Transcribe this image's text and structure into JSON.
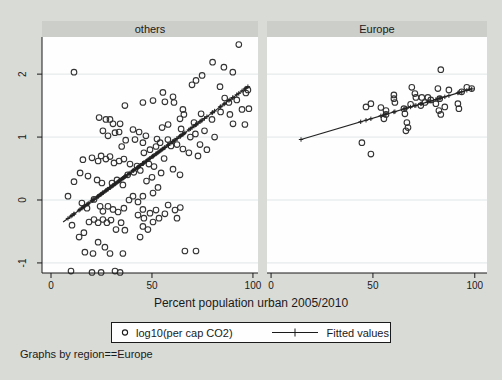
{
  "caption": "Graphs by region==Europe",
  "legend": {
    "items": [
      {
        "marker": "circle-marker-icon",
        "label": "log10(per cap CO2)"
      },
      {
        "marker": "fitted-line-icon",
        "label": "Fitted values"
      }
    ]
  },
  "colors": {
    "background": "#d9dbd7",
    "panel_title_band": "#cccec9",
    "plot_background": "#fefefe",
    "gridline": "#e0e6e7",
    "ink": "#1a1a1a"
  },
  "chart_data": {
    "type": "scatter",
    "title": "",
    "xlabel": "Percent population urban 2005/2010",
    "ylabel": "",
    "xticks": [
      0,
      50,
      100
    ],
    "yticks": [
      2,
      1,
      0,
      -1
    ],
    "ylim": [
      -1.16,
      2.59
    ],
    "grid": "horizontal",
    "legend_position": "bottom",
    "series_labels": [
      "log10(per cap CO2)",
      "Fitted values"
    ],
    "panels": [
      {
        "title": "others",
        "xlim": [
          -4.46,
          102.5
        ],
        "fit": {
          "slope": 0.0235,
          "intercept": -0.49,
          "x_range": [
            6,
            97.5
          ]
        },
        "points": [
          [
            11.4,
            2.03
          ],
          [
            93,
            2.47
          ],
          [
            80,
            2.19
          ],
          [
            85.6,
            2.11
          ],
          [
            90,
            2.03
          ],
          [
            74.8,
            1.98
          ],
          [
            83.7,
            1.8
          ],
          [
            69.8,
            1.83
          ],
          [
            71.8,
            1.9
          ],
          [
            55.4,
            1.71
          ],
          [
            60.4,
            1.64
          ],
          [
            92,
            1.59
          ],
          [
            36.6,
            1.5
          ],
          [
            45.5,
            1.55
          ],
          [
            50.5,
            1.58
          ],
          [
            56.4,
            1.56
          ],
          [
            60.9,
            1.55
          ],
          [
            65.3,
            1.44
          ],
          [
            65.8,
            1.36
          ],
          [
            74.3,
            1.37
          ],
          [
            70.8,
            1.23
          ],
          [
            63.9,
            1.29
          ],
          [
            64.4,
            1.13
          ],
          [
            79.7,
            1.28
          ],
          [
            88.6,
            1.36
          ],
          [
            90.1,
            1.21
          ],
          [
            94.6,
            1.44
          ],
          [
            88.1,
            1.55
          ],
          [
            23.8,
            1.31
          ],
          [
            27.2,
            1.28
          ],
          [
            29.2,
            1.28
          ],
          [
            30.7,
            1.21
          ],
          [
            34.2,
            1.21
          ],
          [
            25.7,
            1.1
          ],
          [
            28.2,
            1.02
          ],
          [
            31.7,
            1.07
          ],
          [
            33.7,
            1.08
          ],
          [
            40.6,
            1.12
          ],
          [
            43.6,
            1.08
          ],
          [
            47,
            1.02
          ],
          [
            41.6,
            0.96
          ],
          [
            45.5,
            0.91
          ],
          [
            52.5,
            0.97
          ],
          [
            54,
            0.91
          ],
          [
            57.9,
            0.96
          ],
          [
            59.4,
            0.86
          ],
          [
            62.4,
            0.88
          ],
          [
            65.3,
            0.81
          ],
          [
            68.3,
            0.75
          ],
          [
            73.8,
            0.88
          ],
          [
            77.2,
            0.8
          ],
          [
            72.8,
            0.7
          ],
          [
            15.8,
            0.64
          ],
          [
            20.3,
            0.67
          ],
          [
            23.3,
            0.62
          ],
          [
            24.8,
            0.7
          ],
          [
            27.2,
            0.65
          ],
          [
            29.2,
            0.69
          ],
          [
            31.2,
            0.59
          ],
          [
            33.7,
            0.62
          ],
          [
            36.1,
            0.65
          ],
          [
            39.1,
            0.57
          ],
          [
            42.6,
            0.54
          ],
          [
            48.5,
            0.57
          ],
          [
            51,
            0.53
          ],
          [
            60.4,
            0.49
          ],
          [
            54.5,
            0.43
          ],
          [
            63.9,
            0.4
          ],
          [
            14.4,
            0.43
          ],
          [
            18.3,
            0.38
          ],
          [
            11.4,
            0.29
          ],
          [
            22.8,
            0.32
          ],
          [
            25.2,
            0.27
          ],
          [
            30.2,
            0.27
          ],
          [
            32.7,
            0.32
          ],
          [
            35.6,
            0.24
          ],
          [
            38,
            0.4
          ],
          [
            41,
            0.44
          ],
          [
            44.2,
            0.47
          ],
          [
            47.3,
            0.3
          ],
          [
            50,
            0.36
          ],
          [
            53,
            0.2
          ],
          [
            56,
            0.66
          ],
          [
            46,
            0.75
          ],
          [
            49,
            0.8
          ],
          [
            52,
            0.85
          ],
          [
            55,
            1.15
          ],
          [
            58,
            1.2
          ],
          [
            37,
            0.95
          ],
          [
            35,
            0.85
          ],
          [
            69,
            1
          ],
          [
            71.5,
            1.05
          ],
          [
            76,
            1.1
          ],
          [
            81,
            1
          ],
          [
            84,
            1.4
          ],
          [
            86,
            1.62
          ],
          [
            96,
            1.2
          ],
          [
            96.5,
            1.7
          ],
          [
            97.5,
            1.75
          ],
          [
            98,
            1.45
          ],
          [
            8.4,
            0.06
          ],
          [
            15.3,
            -0.05
          ],
          [
            17.8,
            -0.13
          ],
          [
            21.3,
            0.01
          ],
          [
            24.3,
            -0.1
          ],
          [
            25.7,
            -0.18
          ],
          [
            28.2,
            -0.1
          ],
          [
            30.7,
            -0.15
          ],
          [
            33.2,
            -0.19
          ],
          [
            36.1,
            -0.13
          ],
          [
            38.6,
            0
          ],
          [
            40.6,
            0.06
          ],
          [
            43.1,
            -0.03
          ],
          [
            45.5,
            -0.15
          ],
          [
            49,
            -0.21
          ],
          [
            52,
            -0.16
          ],
          [
            56.4,
            -0.22
          ],
          [
            45.5,
            0.06
          ],
          [
            50.5,
            0.11
          ],
          [
            10.4,
            -0.4
          ],
          [
            13.9,
            -0.59
          ],
          [
            16.3,
            -0.52
          ],
          [
            18.8,
            -0.35
          ],
          [
            21.3,
            -0.31
          ],
          [
            23.3,
            -0.36
          ],
          [
            25.7,
            -0.31
          ],
          [
            27.7,
            -0.36
          ],
          [
            29.7,
            -0.32
          ],
          [
            32.2,
            -0.47
          ],
          [
            34.7,
            -0.36
          ],
          [
            36.6,
            -0.48
          ],
          [
            43.1,
            -0.24
          ],
          [
            46,
            -0.29
          ],
          [
            45.5,
            -0.42
          ],
          [
            23.3,
            -0.67
          ],
          [
            26.7,
            -0.75
          ],
          [
            16.8,
            -0.83
          ],
          [
            20.8,
            -0.85
          ],
          [
            29.2,
            -0.85
          ],
          [
            35.6,
            -0.85
          ],
          [
            9.9,
            -1.13
          ],
          [
            20.3,
            -1.15
          ],
          [
            24.8,
            -1.15
          ],
          [
            31.7,
            -1.13
          ],
          [
            34.2,
            -1.15
          ],
          [
            44.1,
            -0.59
          ],
          [
            48,
            -0.47
          ],
          [
            50.5,
            -0.35
          ],
          [
            53.5,
            -0.29
          ],
          [
            62.4,
            -0.29
          ],
          [
            61.4,
            -0.16
          ],
          [
            64,
            -0.12
          ],
          [
            66.3,
            -0.81
          ],
          [
            71.8,
            -0.81
          ],
          [
            58,
            -0.08
          ]
        ]
      },
      {
        "title": "Europe",
        "xlim": [
          -2,
          106
        ],
        "fit": {
          "slope": 0.0096,
          "intercept": 0.82,
          "x_range": [
            14.7,
            98.5
          ],
          "marker_xs": [
            14.7,
            44,
            46.6,
            49,
            53.9,
            55.4,
            56.4,
            60.3,
            60.8,
            65.2,
            65.7,
            66.7,
            68.5,
            70.6,
            71.1,
            73.5,
            74,
            77,
            78.4,
            80.9,
            82,
            82.8,
            83.3,
            85.3,
            87.3,
            91.7,
            92.2,
            93.6,
            96.1,
            98.5
          ]
        },
        "points": [
          [
            83.3,
            2.07
          ],
          [
            69.1,
            1.79
          ],
          [
            81.9,
            1.77
          ],
          [
            87.3,
            1.75
          ],
          [
            96.1,
            1.79
          ],
          [
            98.5,
            1.77
          ],
          [
            60.3,
            1.67
          ],
          [
            60.3,
            1.61
          ],
          [
            60.8,
            1.55
          ],
          [
            70.6,
            1.69
          ],
          [
            71.1,
            1.63
          ],
          [
            74,
            1.63
          ],
          [
            77,
            1.63
          ],
          [
            78.4,
            1.59
          ],
          [
            82.8,
            1.61
          ],
          [
            80.9,
            1.53
          ],
          [
            85.3,
            1.48
          ],
          [
            91.7,
            1.53
          ],
          [
            92.2,
            1.45
          ],
          [
            46.6,
            1.48
          ],
          [
            49,
            1.53
          ],
          [
            53.9,
            1.47
          ],
          [
            56.4,
            1.42
          ],
          [
            56.4,
            1.36
          ],
          [
            55.4,
            1.29
          ],
          [
            65.2,
            1.45
          ],
          [
            65.7,
            1.37
          ],
          [
            66.7,
            1.23
          ],
          [
            67.2,
            1.15
          ],
          [
            82.4,
            1.42
          ],
          [
            83.3,
            1.36
          ],
          [
            44.6,
            0.91
          ],
          [
            49,
            0.73
          ],
          [
            66.2,
            1.1
          ],
          [
            93.6,
            1.72
          ],
          [
            73.5,
            1.5
          ],
          [
            68.5,
            1.52
          ],
          [
            75.5,
            1.55
          ]
        ]
      }
    ]
  }
}
